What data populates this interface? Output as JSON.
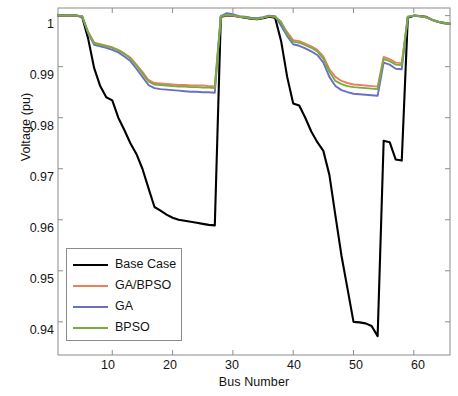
{
  "chart_data": {
    "type": "line",
    "title": "",
    "xlabel": "Bus Number",
    "ylabel": "Voltage (pu)",
    "xlim": [
      1,
      66
    ],
    "ylim": [
      0.9335,
      1.0015
    ],
    "xticks": [
      10,
      20,
      30,
      40,
      50,
      60
    ],
    "yticks": [
      0.94,
      0.95,
      0.96,
      0.97,
      0.98,
      0.99,
      1
    ],
    "ytick_labels": [
      "0.94",
      "0.95",
      "0.96",
      "0.97",
      "0.98",
      "0.99",
      "1"
    ],
    "xtick_labels": [
      "10",
      "20",
      "30",
      "40",
      "50",
      "60"
    ],
    "grid": false,
    "legend_position": "lower left",
    "x": [
      1,
      2,
      3,
      4,
      5,
      6,
      7,
      8,
      9,
      10,
      11,
      12,
      13,
      14,
      15,
      16,
      17,
      18,
      19,
      20,
      21,
      22,
      23,
      24,
      25,
      26,
      27,
      28,
      29,
      30,
      31,
      32,
      33,
      34,
      35,
      36,
      37,
      38,
      39,
      40,
      41,
      42,
      43,
      44,
      45,
      46,
      47,
      48,
      49,
      50,
      51,
      52,
      53,
      54,
      55,
      56,
      57,
      58,
      59,
      60,
      61,
      62,
      63,
      64,
      65,
      66
    ],
    "series": [
      {
        "name": "Base Case",
        "color": "#000000",
        "values": [
          1.0,
          1.0,
          1.0,
          1.0,
          0.9998,
          0.9955,
          0.9897,
          0.9862,
          0.984,
          0.9834,
          0.98,
          0.9776,
          0.975,
          0.9729,
          0.97,
          0.9662,
          0.9625,
          0.9618,
          0.961,
          0.9604,
          0.96,
          0.9598,
          0.9596,
          0.9594,
          0.9592,
          0.959,
          0.9589,
          0.9998,
          1.0,
          1.0,
          0.9998,
          0.9996,
          0.9994,
          0.9993,
          0.9995,
          0.9998,
          0.9996,
          0.995,
          0.988,
          0.9828,
          0.9824,
          0.98,
          0.9773,
          0.9752,
          0.9735,
          0.9688,
          0.9608,
          0.953,
          0.9465,
          0.94,
          0.9399,
          0.9397,
          0.9392,
          0.9372,
          0.9755,
          0.9752,
          0.9718,
          0.9716,
          0.9996,
          1.0,
          0.9999,
          0.9998,
          0.9992,
          0.9988,
          0.9985,
          0.9984
        ]
      },
      {
        "name": "GA/BPSO",
        "color": "#ec7f5c",
        "values": [
          1.0,
          1.0,
          1.0,
          1.0,
          0.9999,
          0.9968,
          0.9947,
          0.9944,
          0.9941,
          0.9938,
          0.9933,
          0.9926,
          0.9918,
          0.9904,
          0.989,
          0.9874,
          0.9868,
          0.9867,
          0.9866,
          0.9865,
          0.9864,
          0.9864,
          0.9863,
          0.9863,
          0.9863,
          0.9862,
          0.9862,
          0.9999,
          1.0,
          1.0,
          0.9998,
          0.9997,
          0.9995,
          0.9994,
          0.9996,
          0.9999,
          0.9998,
          0.9985,
          0.9968,
          0.9952,
          0.995,
          0.9945,
          0.994,
          0.9933,
          0.992,
          0.9895,
          0.988,
          0.9872,
          0.9868,
          0.9865,
          0.9864,
          0.9863,
          0.9862,
          0.9861,
          0.9919,
          0.9915,
          0.9908,
          0.9907,
          0.9998,
          1.0,
          0.9999,
          0.9997,
          0.9992,
          0.9988,
          0.9986,
          0.9984
        ]
      },
      {
        "name": "GA",
        "color": "#6b6fc4",
        "values": [
          1.0,
          1.0,
          1.0,
          1.0,
          0.9999,
          0.9966,
          0.9943,
          0.994,
          0.9937,
          0.9933,
          0.9928,
          0.992,
          0.9911,
          0.9896,
          0.988,
          0.9864,
          0.9858,
          0.9856,
          0.9855,
          0.9854,
          0.9853,
          0.9852,
          0.9851,
          0.9851,
          0.985,
          0.985,
          0.9849,
          0.9999,
          1.0005,
          1.0003,
          0.9999,
          0.9998,
          0.9996,
          0.9995,
          0.9997,
          1.0,
          0.9999,
          0.998,
          0.996,
          0.9944,
          0.9941,
          0.9936,
          0.993,
          0.9923,
          0.9908,
          0.988,
          0.9862,
          0.9854,
          0.985,
          0.9847,
          0.9846,
          0.9845,
          0.9844,
          0.9843,
          0.9908,
          0.9904,
          0.9896,
          0.9895,
          0.9997,
          1.0,
          0.9999,
          0.9997,
          0.9992,
          0.9988,
          0.9986,
          0.9984
        ]
      },
      {
        "name": "BPSO",
        "color": "#77ac43",
        "values": [
          1.0,
          1.0,
          1.0,
          1.0,
          0.9999,
          0.9967,
          0.9946,
          0.9943,
          0.994,
          0.9937,
          0.9932,
          0.9925,
          0.9916,
          0.9902,
          0.9887,
          0.9871,
          0.9865,
          0.9864,
          0.9863,
          0.9862,
          0.9861,
          0.9861,
          0.986,
          0.986,
          0.9859,
          0.9859,
          0.9858,
          0.9999,
          1.0002,
          1.0001,
          0.9998,
          0.9997,
          0.9995,
          0.9994,
          0.9996,
          0.9999,
          0.9998,
          0.9988,
          0.9964,
          0.9949,
          0.9947,
          0.9942,
          0.9937,
          0.993,
          0.9916,
          0.989,
          0.9872,
          0.9866,
          0.9862,
          0.986,
          0.9859,
          0.9858,
          0.9857,
          0.9856,
          0.9915,
          0.9911,
          0.9904,
          0.9903,
          0.9998,
          1.0,
          0.9999,
          0.9997,
          0.9992,
          0.9988,
          0.9986,
          0.9984
        ]
      }
    ],
    "legend": [
      {
        "label": "Base Case",
        "color": "#000000",
        "width": 2.6
      },
      {
        "label": "GA/BPSO",
        "color": "#ec7f5c",
        "width": 2.2
      },
      {
        "label": "GA",
        "color": "#6b6fc4",
        "width": 2.2
      },
      {
        "label": "BPSO",
        "color": "#77ac43",
        "width": 2.2
      }
    ],
    "axis_color": "#8c8c8c",
    "text_color": "#141414"
  }
}
